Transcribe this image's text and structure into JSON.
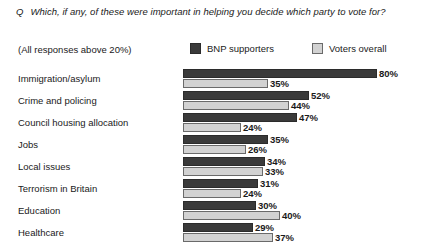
{
  "question": {
    "marker": "Q",
    "text": "Which, if any, of these were important in helping you decide which party to vote for?"
  },
  "subtitle": "(All responses above 20%)",
  "legend": {
    "items": [
      {
        "label": "BNP supporters",
        "color": "#3a3a3a",
        "swatch_icon": "dark-square-swatch"
      },
      {
        "label": "Voters overall",
        "color": "#d2d2d2",
        "swatch_icon": "light-square-swatch"
      }
    ]
  },
  "chart_data": {
    "type": "bar",
    "orientation": "horizontal",
    "title": "Which, if any, of these were important in helping you decide which party to vote for?",
    "subtitle": "(All responses above 20%)",
    "xlabel": "",
    "ylabel": "",
    "xlim": [
      0,
      80
    ],
    "grid": false,
    "legend_position": "top",
    "value_suffix": "%",
    "categories": [
      "Immigration/asylum",
      "Crime and policing",
      "Council housing allocation",
      "Jobs",
      "Local issues",
      "Terrorism in Britain",
      "Education",
      "Healthcare"
    ],
    "series": [
      {
        "name": "BNP supporters",
        "color": "#3a3a3a",
        "values": [
          80,
          52,
          47,
          35,
          34,
          31,
          30,
          29
        ],
        "labels": [
          "80%",
          "52%",
          "47%",
          "35%",
          "34%",
          "31%",
          "30%",
          "29%"
        ]
      },
      {
        "name": "Voters overall",
        "color": "#d2d2d2",
        "values": [
          35,
          44,
          24,
          26,
          33,
          24,
          40,
          37
        ],
        "labels": [
          "35%",
          "44%",
          "24%",
          "26%",
          "33%",
          "24%",
          "40%",
          "37%"
        ]
      }
    ]
  }
}
